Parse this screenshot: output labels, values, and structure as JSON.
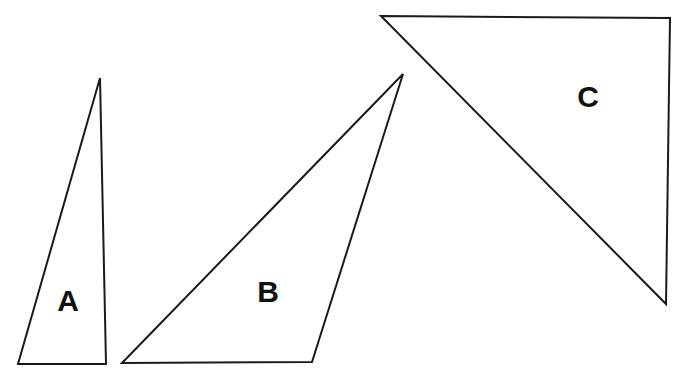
{
  "figure": {
    "kind": "geometry-diagram",
    "canvas": {
      "width": 679,
      "height": 378,
      "background": "#ffffff"
    },
    "style": {
      "stroke_color": "#1a1a1a",
      "stroke_width": 2,
      "fill": "#ffffff",
      "label_color": "#111111"
    },
    "shapes": [
      {
        "id": "triangle-a",
        "label": "A",
        "type": "triangle",
        "points": "18,364 100,78 106,364",
        "vertices": [
          [
            18,
            364
          ],
          [
            100,
            78
          ],
          [
            106,
            364
          ]
        ],
        "label_position": [
          68,
          300
        ]
      },
      {
        "id": "triangle-b",
        "label": "B",
        "type": "triangle",
        "points": "122,363 403,74 312,362",
        "vertices": [
          [
            122,
            363
          ],
          [
            403,
            74
          ],
          [
            312,
            362
          ]
        ],
        "label_position": [
          268,
          291
        ]
      },
      {
        "id": "triangle-c",
        "label": "C",
        "type": "triangle",
        "points": "381,16 670,18 666,304",
        "vertices": [
          [
            381,
            16
          ],
          [
            670,
            18
          ],
          [
            666,
            304
          ]
        ],
        "label_position": [
          588,
          96
        ]
      }
    ]
  }
}
